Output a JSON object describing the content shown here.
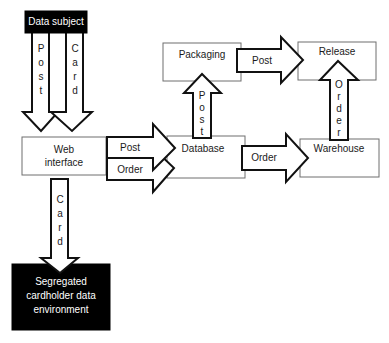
{
  "nodes": {
    "data_subject": {
      "label": "Data subject"
    },
    "web_interface": {
      "label_lines": [
        "Web",
        "interface"
      ]
    },
    "segregated_cde": {
      "label_lines": [
        "Segregated",
        "cardholder data",
        "environment"
      ]
    },
    "packaging": {
      "label": "Packaging"
    },
    "release": {
      "label": "Release"
    },
    "database": {
      "label": "Database"
    },
    "warehouse": {
      "label": "Warehouse"
    }
  },
  "edges": [
    {
      "id": "subject-to-web-post",
      "from": "Data subject",
      "to": "Web interface",
      "label": "Post",
      "orientation": "vertical"
    },
    {
      "id": "subject-to-web-card",
      "from": "Data subject",
      "to": "Web interface",
      "label": "Card",
      "orientation": "vertical"
    },
    {
      "id": "web-to-cde-card",
      "from": "Web interface",
      "to": "Segregated cardholder data environment",
      "label": "Card",
      "orientation": "vertical"
    },
    {
      "id": "web-to-db-post",
      "from": "Web interface",
      "to": "Database",
      "label": "Post",
      "orientation": "horizontal"
    },
    {
      "id": "web-to-db-order",
      "from": "Web interface",
      "to": "Database",
      "label": "Order",
      "orientation": "horizontal"
    },
    {
      "id": "db-to-packaging-post",
      "from": "Database",
      "to": "Packaging",
      "label": "Post",
      "orientation": "vertical"
    },
    {
      "id": "packaging-to-release-post",
      "from": "Packaging",
      "to": "Release",
      "label": "Post",
      "orientation": "horizontal"
    },
    {
      "id": "db-to-warehouse-order",
      "from": "Database",
      "to": "Warehouse",
      "label": "Order",
      "orientation": "horizontal"
    },
    {
      "id": "warehouse-to-release-order",
      "from": "Warehouse",
      "to": "Release",
      "label": "Order",
      "orientation": "vertical"
    }
  ]
}
